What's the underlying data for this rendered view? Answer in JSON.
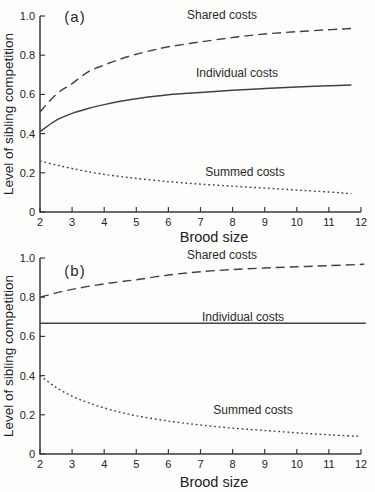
{
  "figure": {
    "background": "#fdfdfb",
    "line_color": "#424242",
    "text_color": "#2a2a2a"
  },
  "chart_data": [
    {
      "type": "line",
      "panel_label": "(a)",
      "xlabel": "Brood size",
      "ylabel": "Level of sibling competition",
      "xlim": [
        2,
        12
      ],
      "ylim": [
        0,
        1
      ],
      "grid": false,
      "legend_position": "inline-labels",
      "x_ticks": [
        2,
        3,
        4,
        5,
        6,
        7,
        8,
        9,
        10,
        11,
        12
      ],
      "y_ticks": [
        {
          "value": 0,
          "label": "0"
        },
        {
          "value": 0.2,
          "label": "0.2"
        },
        {
          "value": 0.4,
          "label": "0.4"
        },
        {
          "value": 0.6,
          "label": "0.6"
        },
        {
          "value": 0.8,
          "label": "0.8"
        },
        {
          "value": 1.0,
          "label": "1.0"
        }
      ],
      "series": [
        {
          "name": "Shared costs",
          "style": "dashed",
          "points": [
            [
              2,
              0.51
            ],
            [
              2.5,
              0.6
            ],
            [
              3,
              0.655
            ],
            [
              3.5,
              0.715
            ],
            [
              4,
              0.75
            ],
            [
              4.5,
              0.78
            ],
            [
              5,
              0.805
            ],
            [
              5.5,
              0.825
            ],
            [
              6,
              0.843
            ],
            [
              7,
              0.868
            ],
            [
              8,
              0.89
            ],
            [
              9,
              0.908
            ],
            [
              10,
              0.92
            ],
            [
              11,
              0.93
            ],
            [
              11.7,
              0.936
            ]
          ]
        },
        {
          "name": "Individual costs",
          "style": "solid",
          "points": [
            [
              2,
              0.41
            ],
            [
              2.5,
              0.468
            ],
            [
              3,
              0.503
            ],
            [
              3.5,
              0.528
            ],
            [
              4,
              0.548
            ],
            [
              4.5,
              0.565
            ],
            [
              5,
              0.578
            ],
            [
              6,
              0.598
            ],
            [
              7,
              0.61
            ],
            [
              8,
              0.621
            ],
            [
              9,
              0.63
            ],
            [
              10,
              0.638
            ],
            [
              11,
              0.644
            ],
            [
              11.7,
              0.648
            ]
          ]
        },
        {
          "name": "Summed costs",
          "style": "dotted",
          "points": [
            [
              2,
              0.26
            ],
            [
              2.5,
              0.24
            ],
            [
              3,
              0.222
            ],
            [
              3.5,
              0.205
            ],
            [
              4,
              0.192
            ],
            [
              4.5,
              0.181
            ],
            [
              5,
              0.171
            ],
            [
              6,
              0.155
            ],
            [
              7,
              0.142
            ],
            [
              8,
              0.132
            ],
            [
              9,
              0.122
            ],
            [
              10,
              0.112
            ],
            [
              11,
              0.102
            ],
            [
              11.7,
              0.094
            ]
          ]
        }
      ]
    },
    {
      "type": "line",
      "panel_label": "(b)",
      "xlabel": "Brood size",
      "ylabel": "Level of sibling competition",
      "xlim": [
        2,
        12
      ],
      "ylim": [
        0,
        1
      ],
      "grid": false,
      "legend_position": "inline-labels",
      "x_ticks": [
        2,
        3,
        4,
        5,
        6,
        7,
        8,
        9,
        10,
        11,
        12
      ],
      "y_ticks": [
        {
          "value": 0,
          "label": "0"
        },
        {
          "value": 0.2,
          "label": "0.2"
        },
        {
          "value": 0.4,
          "label": "0.4"
        },
        {
          "value": 0.6,
          "label": "0.6"
        },
        {
          "value": 0.8,
          "label": "0.8"
        },
        {
          "value": 1.0,
          "label": "1.0"
        }
      ],
      "series": [
        {
          "name": "Shared costs",
          "style": "dashed",
          "points": [
            [
              2,
              0.8
            ],
            [
              2.5,
              0.822
            ],
            [
              3,
              0.84
            ],
            [
              3.5,
              0.855
            ],
            [
              4,
              0.868
            ],
            [
              4.5,
              0.879
            ],
            [
              5,
              0.889
            ],
            [
              6,
              0.913
            ],
            [
              7,
              0.93
            ],
            [
              8,
              0.941
            ],
            [
              9,
              0.949
            ],
            [
              10,
              0.955
            ],
            [
              11,
              0.961
            ],
            [
              12.1,
              0.968
            ]
          ]
        },
        {
          "name": "Individual costs",
          "style": "solid",
          "points": [
            [
              2,
              0.667
            ],
            [
              7,
              0.667
            ],
            [
              12.15,
              0.667
            ]
          ]
        },
        {
          "name": "Summed costs",
          "style": "dotted",
          "points": [
            [
              2,
              0.4
            ],
            [
              2.5,
              0.34
            ],
            [
              3,
              0.295
            ],
            [
              3.5,
              0.262
            ],
            [
              4,
              0.235
            ],
            [
              4.5,
              0.213
            ],
            [
              5,
              0.195
            ],
            [
              6,
              0.168
            ],
            [
              7,
              0.148
            ],
            [
              8,
              0.132
            ],
            [
              9,
              0.12
            ],
            [
              10,
              0.108
            ],
            [
              11,
              0.098
            ],
            [
              12,
              0.09
            ]
          ]
        }
      ]
    }
  ]
}
